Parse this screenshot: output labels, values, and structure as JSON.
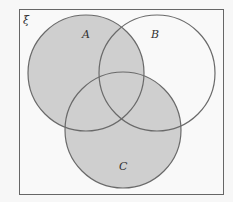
{
  "diagram": {
    "type": "venn",
    "universal_set_label": "ξ",
    "sets": [
      {
        "name": "A",
        "label": "A",
        "cx": 86,
        "cy": 73,
        "r": 58
      },
      {
        "name": "B",
        "label": "B",
        "cx": 157,
        "cy": 73,
        "r": 58
      },
      {
        "name": "C",
        "label": "C",
        "cx": 123,
        "cy": 130,
        "r": 58
      }
    ],
    "shaded_region": "A ∪ C",
    "colors": {
      "background": "#f7f7f7",
      "frame": "#666666",
      "circle_stroke": "#6a6a6a",
      "shade": "#cfcfcf",
      "unshaded": "#f9f9f9"
    }
  }
}
